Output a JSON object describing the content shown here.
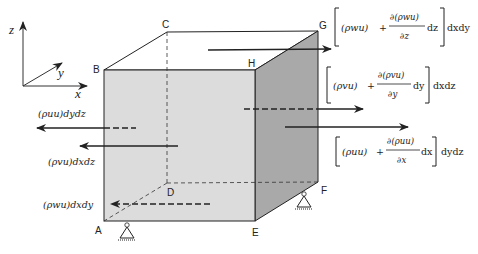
{
  "diagram": {
    "type": "control-volume-cube",
    "axes": {
      "x": "x",
      "y": "y",
      "z": "z"
    },
    "vertices": {
      "A": "A",
      "B": "B",
      "C": "C",
      "D": "D",
      "E": "E",
      "F": "F",
      "G": "G",
      "H": "H"
    },
    "fluxes": {
      "top_out": {
        "bracket_term": "(ρwu)",
        "plus": "+",
        "numerator": "∂(ρwu)",
        "denominator": "∂z",
        "diff": "dz",
        "area": "dxdy"
      },
      "back_out": {
        "bracket_term": "(ρvu)",
        "plus": "+",
        "numerator": "∂(ρvu)",
        "denominator": "∂y",
        "diff": "dy",
        "area": "dxdz"
      },
      "right_out": {
        "bracket_term": "(ρuu)",
        "plus": "+",
        "numerator": "∂(ρuu)",
        "denominator": "∂x",
        "diff": "dx",
        "area": "dydz"
      },
      "left_in": {
        "label": "(ρuu)dydz"
      },
      "front_in": {
        "label": "(ρvu)dxdz"
      },
      "bottom_in": {
        "label": "(ρwu)dxdy"
      }
    },
    "colors": {
      "front_face": "#dcdcdc",
      "side_face": "#a9a9a9",
      "top_face": "#ffffff",
      "stroke": "#222222"
    }
  }
}
